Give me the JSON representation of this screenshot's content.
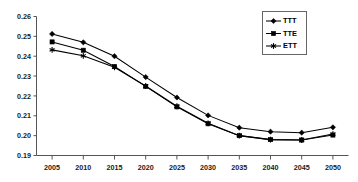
{
  "chart_data": {
    "type": "line",
    "title": "",
    "subtitle": "",
    "xlabel": "",
    "ylabel": "",
    "categories": [
      2005,
      2010,
      2015,
      2020,
      2025,
      2030,
      2035,
      2040,
      2045,
      2050
    ],
    "x": [
      2005,
      2010,
      2015,
      2020,
      2025,
      2030,
      2035,
      2040,
      2045,
      2050
    ],
    "xlim": [
      2002.5,
      2052.5
    ],
    "ylim": [
      0.19,
      0.26
    ],
    "yticks": [
      0.19,
      0.2,
      0.21,
      0.22,
      0.23,
      0.24,
      0.25,
      0.26
    ],
    "ytick_labels": [
      "0.19",
      "0.20",
      "0.21",
      "0.22",
      "0.23",
      "0.24",
      "0.25",
      "0.26"
    ],
    "xticks": [
      2005,
      2010,
      2015,
      2020,
      2025,
      2030,
      2035,
      2040,
      2045,
      2050
    ],
    "xtick_labels": [
      "2005",
      "2010",
      "2015",
      "2020",
      "2025",
      "2030",
      "2035",
      "2040",
      "2045",
      "2050"
    ],
    "grid": false,
    "legend_position": "top-right",
    "legend_entries": [
      "TTT",
      "TTE",
      "ETT"
    ],
    "series": [
      {
        "name": "TTT",
        "marker": "diamond",
        "color": "#000000",
        "values": [
          0.2512,
          0.247,
          0.24,
          0.2295,
          0.2192,
          0.2102,
          0.204,
          0.202,
          0.2015,
          0.2042
        ]
      },
      {
        "name": "TTE",
        "marker": "square",
        "color": "#000000",
        "values": [
          0.2472,
          0.243,
          0.2348,
          0.2248,
          0.2145,
          0.206,
          0.2,
          0.198,
          0.1978,
          0.2003
        ]
      },
      {
        "name": "ETT",
        "marker": "asterisk",
        "color": "#000000",
        "values": [
          0.2432,
          0.2402,
          0.2344,
          0.225,
          0.2148,
          0.2062,
          0.2,
          0.198,
          0.1978,
          0.2008
        ]
      }
    ]
  },
  "legend": {
    "items": [
      {
        "label": "TTT"
      },
      {
        "label": "TTE"
      },
      {
        "label": "ETT"
      }
    ]
  },
  "axes": {
    "y_axis_name": "y-axis",
    "x_axis_name": "x-axis"
  }
}
